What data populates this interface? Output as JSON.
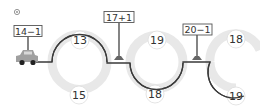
{
  "exercise": {
    "marker_icon": "circled-number-icon",
    "vehicle_icon": "car-icon",
    "signs": [
      {
        "text": "14−1",
        "x": 28,
        "y": 31
      },
      {
        "text": "17+1",
        "x": 119,
        "y": 17
      },
      {
        "text": "20−1",
        "x": 197,
        "y": 29
      }
    ],
    "circles": [
      {
        "text": "13",
        "x": 80,
        "y": 40,
        "crossed": true
      },
      {
        "text": "19",
        "x": 157,
        "y": 40,
        "crossed": false
      },
      {
        "text": "18",
        "x": 236,
        "y": 39,
        "crossed": false
      },
      {
        "text": "15",
        "x": 79,
        "y": 95,
        "crossed": false
      },
      {
        "text": "18",
        "x": 155,
        "y": 94,
        "crossed": true
      },
      {
        "text": "19",
        "x": 236,
        "y": 96,
        "crossed": true
      }
    ],
    "colors": {
      "road_line": "#3a3a3a",
      "track_gray": "#e6e6e6",
      "sign_border": "#555555",
      "car": "#9e9e9e",
      "circle_border": "#d8d8d8"
    }
  }
}
